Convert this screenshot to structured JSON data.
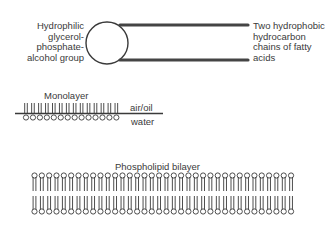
{
  "molecule": {
    "head_label": "Hydrophilic\nglycerol-\nphosphate-\nalcohol group",
    "tail_label": "Two hydrophobic\nhydrocarbon\nchains of fatty\nacids"
  },
  "monolayer": {
    "title": "Monolayer",
    "upper_phase": "air/oil",
    "lower_phase": "water",
    "lipid_count": 14
  },
  "bilayer": {
    "title": "Phospholipid bilayer",
    "lipid_count": 36
  },
  "colors": {
    "stroke": "#3a3a3a",
    "chain": "#444444",
    "background": "#ffffff"
  }
}
